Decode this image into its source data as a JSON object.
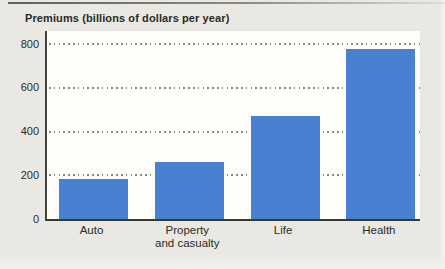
{
  "title": "Premiums (billions of dollars per year)",
  "chart_data": {
    "type": "bar",
    "title": "Premiums (billions of dollars per year)",
    "categories": [
      "Auto",
      "Property and casualty",
      "Life",
      "Health"
    ],
    "category_lines": [
      [
        "Auto"
      ],
      [
        "Property",
        "and casualty"
      ],
      [
        "Life"
      ],
      [
        "Health"
      ]
    ],
    "values": [
      185,
      260,
      470,
      775
    ],
    "xlabel": "",
    "ylabel": "Premiums (billions of dollars per year)",
    "ylim": [
      0,
      800
    ],
    "yticks": [
      0,
      200,
      400,
      600,
      800
    ],
    "grid": "horizontal dotted",
    "legend": "none",
    "bar_color": "#4a80d2"
  },
  "colors": {
    "bar": "#4a80d2",
    "page_background": "#e9e8e2",
    "plot_background": "#fdfdfa",
    "axis": "#3c3c34",
    "gridline": "#8b8b86",
    "text": "#2b2b26"
  }
}
